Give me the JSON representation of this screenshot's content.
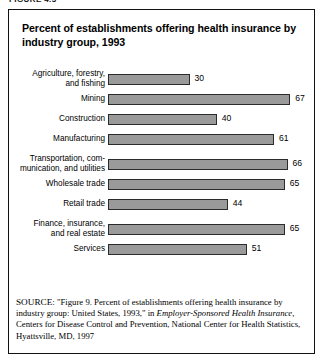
{
  "figure_caption": "FIGURE 4.3",
  "title": "Percent of establishments offering health insurance by industry group, 1993",
  "source": {
    "label": "SOURCE:",
    "part1": " \"Figure 9. Percent of establishments offering health insurance by industry group: United States, 1993,\" in ",
    "italic1": "Employer-Sponsored Health Insurance,",
    "part2": " Centers for Disease Control and Prevention, National Center for Health Statistics, Hyattsville, MD, 1997"
  },
  "colors": {
    "bar_fill": "#9a9a9a",
    "bar_border": "#2b2b2b",
    "frame": "#111111",
    "text": "#000000"
  },
  "chart_data": {
    "type": "bar",
    "orientation": "horizontal",
    "title": "Percent of establishments offering health insurance by industry group, 1993",
    "xlabel": "",
    "ylabel": "",
    "xlim": [
      0,
      70
    ],
    "grid": false,
    "legend": "none",
    "categories": [
      "Agriculture, forestry, and fishing",
      "Mining",
      "Construction",
      "Manufacturing",
      "Transportation, communication, and utilities",
      "Wholesale trade",
      "Retail trade",
      "Finance, insurance, and real estate",
      "Services"
    ],
    "values": [
      30,
      67,
      40,
      61,
      66,
      65,
      44,
      65,
      51
    ],
    "bars": [
      {
        "label_line1": "Agriculture, forestry,",
        "label_line2": "and fishing",
        "value": 30,
        "value_text": "30"
      },
      {
        "label_line1": "Mining",
        "label_line2": "",
        "value": 67,
        "value_text": "67"
      },
      {
        "label_line1": "Construction",
        "label_line2": "",
        "value": 40,
        "value_text": "40"
      },
      {
        "label_line1": "Manufacturing",
        "label_line2": "",
        "value": 61,
        "value_text": "61"
      },
      {
        "label_line1": "Transportation, com-",
        "label_line2": "munication, and utilities",
        "value": 66,
        "value_text": "66"
      },
      {
        "label_line1": "Wholesale trade",
        "label_line2": "",
        "value": 65,
        "value_text": "65"
      },
      {
        "label_line1": "Retail trade",
        "label_line2": "",
        "value": 44,
        "value_text": "44"
      },
      {
        "label_line1": "Finance, insurance,",
        "label_line2": "and real estate",
        "value": 65,
        "value_text": "65"
      },
      {
        "label_line1": "Services",
        "label_line2": "",
        "value": 51,
        "value_text": "51"
      }
    ]
  }
}
